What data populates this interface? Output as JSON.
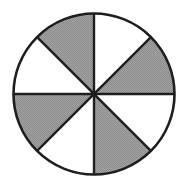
{
  "diagram": {
    "type": "fraction-circle",
    "center": [
      94,
      94
    ],
    "radius": 80.5,
    "sector_count": 8,
    "shaded_count": 4,
    "colors": {
      "shaded": "#9b9b9b",
      "unshaded": "#ffffff",
      "stroke": "#1e1e1e"
    },
    "sectors": [
      {
        "index": 0,
        "from_deg": 0,
        "to_deg": 45,
        "position": "top-right-upper",
        "shaded": false
      },
      {
        "index": 1,
        "from_deg": 45,
        "to_deg": 90,
        "position": "right-upper",
        "shaded": true
      },
      {
        "index": 2,
        "from_deg": 90,
        "to_deg": 135,
        "position": "right-lower",
        "shaded": false
      },
      {
        "index": 3,
        "from_deg": 135,
        "to_deg": 180,
        "position": "bottom-right",
        "shaded": true
      },
      {
        "index": 4,
        "from_deg": 180,
        "to_deg": 225,
        "position": "bottom-left",
        "shaded": false
      },
      {
        "index": 5,
        "from_deg": 225,
        "to_deg": 270,
        "position": "left-lower",
        "shaded": true
      },
      {
        "index": 6,
        "from_deg": 270,
        "to_deg": 315,
        "position": "left-upper",
        "shaded": false
      },
      {
        "index": 7,
        "from_deg": 315,
        "to_deg": 360,
        "position": "top-left",
        "shaded": true
      }
    ]
  }
}
